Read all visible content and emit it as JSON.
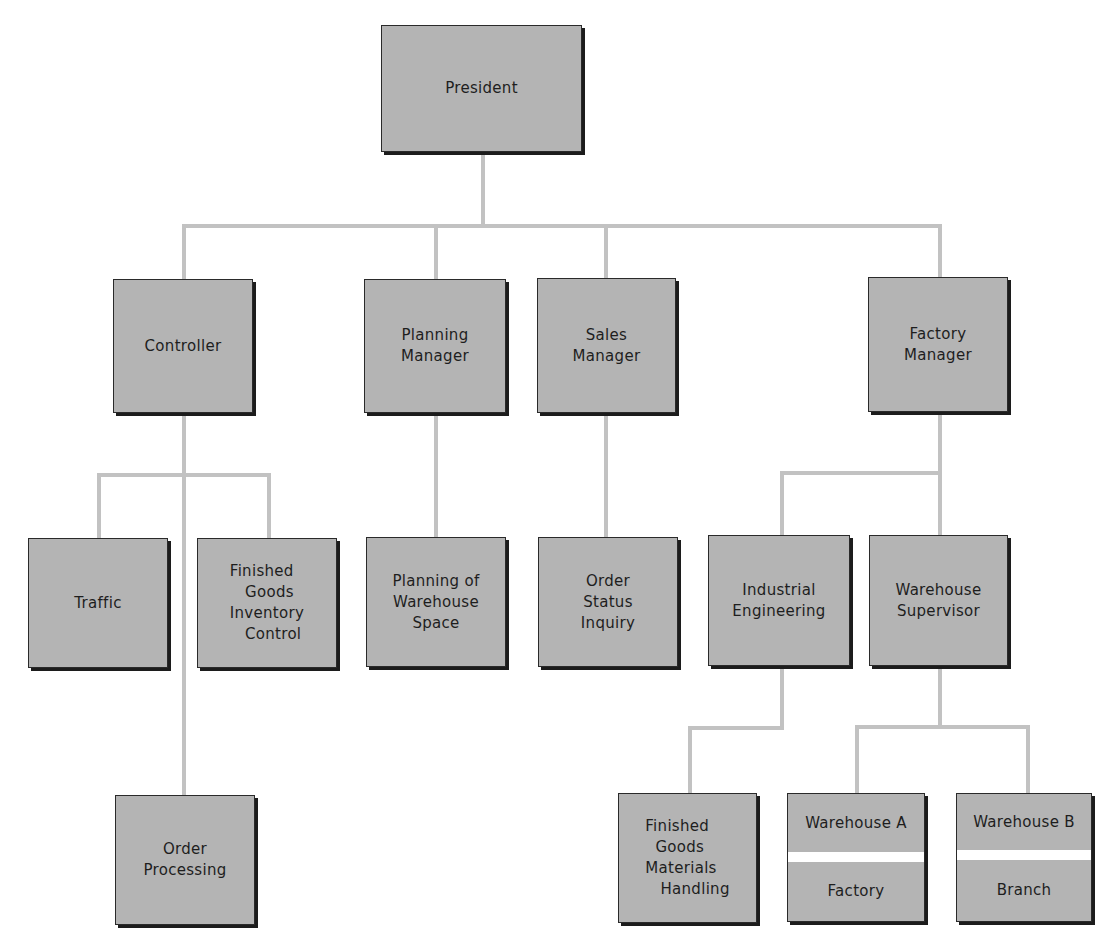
{
  "colors": {
    "box_fill": "#b4b4b4",
    "box_border": "#2a2a2a",
    "connector": "#c2c2c2",
    "background": "#ffffff"
  },
  "nodes": {
    "president": {
      "label": "President"
    },
    "controller": {
      "label": "Controller"
    },
    "planning_manager": {
      "label": "Planning\nManager"
    },
    "sales_manager": {
      "label": "Sales\nManager"
    },
    "factory_manager": {
      "label": "Factory\nManager"
    },
    "traffic": {
      "label": "Traffic"
    },
    "finished_goods_inventory_control": {
      "label": "Finished\n   Goods\nInventory\n   Control"
    },
    "planning_of_warehouse_space": {
      "label": "Planning of\nWarehouse\nSpace"
    },
    "order_status_inquiry": {
      "label": "Order\nStatus\nInquiry"
    },
    "industrial_engineering": {
      "label": "Industrial\nEngineering"
    },
    "warehouse_supervisor": {
      "label": "Warehouse\nSupervisor"
    },
    "order_processing": {
      "label": "Order\nProcessing"
    },
    "finished_goods_materials_handling": {
      "label": "Finished\n  Goods\nMaterials\n   Handling"
    },
    "warehouse_a": {
      "top": "Warehouse A",
      "bottom": "Factory"
    },
    "warehouse_b": {
      "top": "Warehouse B",
      "bottom": "Branch"
    }
  },
  "hierarchy": {
    "President": [
      "Controller",
      "Planning Manager",
      "Sales Manager",
      "Factory Manager"
    ],
    "Controller": [
      "Traffic",
      "Finished Goods Inventory Control",
      "Order Processing"
    ],
    "Planning Manager": [
      "Planning of Warehouse Space"
    ],
    "Sales Manager": [
      "Order Status Inquiry"
    ],
    "Factory Manager": [
      "Industrial Engineering",
      "Warehouse Supervisor"
    ],
    "Industrial Engineering": [
      "Finished Goods Materials Handling"
    ],
    "Warehouse Supervisor": [
      "Warehouse A / Factory",
      "Warehouse B / Branch"
    ]
  }
}
